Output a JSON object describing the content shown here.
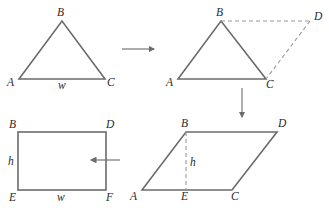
{
  "diagram": {
    "panels": [
      {
        "id": "triangle",
        "vertices": {
          "A": "A",
          "B": "B",
          "C": "C"
        },
        "base_label": "w"
      },
      {
        "id": "triangle-doubled",
        "vertices": {
          "A": "A",
          "B": "B",
          "C": "C",
          "D": "D"
        },
        "dashed_edges": [
          "BD",
          "DC"
        ]
      },
      {
        "id": "parallelogram",
        "vertices": {
          "A": "A",
          "B": "B",
          "C": "C",
          "D": "D",
          "E": "E"
        },
        "height_label": "h",
        "dashed_edges": [
          "BE"
        ]
      },
      {
        "id": "rectangle",
        "vertices": {
          "B": "B",
          "D": "D",
          "E": "E",
          "F": "F"
        },
        "height_label": "h",
        "base_label": "w"
      }
    ],
    "arrows": [
      {
        "from": "triangle",
        "to": "triangle-doubled",
        "direction": "right"
      },
      {
        "from": "triangle-doubled",
        "to": "parallelogram",
        "direction": "down"
      },
      {
        "from": "parallelogram",
        "to": "rectangle",
        "direction": "left"
      }
    ]
  }
}
